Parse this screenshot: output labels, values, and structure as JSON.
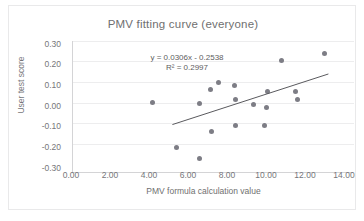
{
  "chart_data": {
    "type": "scatter",
    "title": "PMV fitting curve (everyone)",
    "xlabel": "PMV formula calculation value",
    "ylabel": "User test score",
    "xlim": [
      0.0,
      14.0
    ],
    "ylim": [
      -0.3,
      0.3
    ],
    "xticks": [
      "0.00",
      "2.00",
      "4.00",
      "6.00",
      "8.00",
      "10.00",
      "12.00",
      "14.00"
    ],
    "yticks": [
      "0.30",
      "0.20",
      "0.10",
      "0.00",
      "-0.10",
      "-0.20",
      "-0.30"
    ],
    "grid": true,
    "legend": "none",
    "annotations": {
      "equation": "y = 0.0306x - 0.2538",
      "r_squared": "R² = 0.2997"
    },
    "series": [
      {
        "name": "User test score",
        "marker": "circle",
        "color": "#7d7d85",
        "points": [
          {
            "x": 4.2,
            "y": 0.012
          },
          {
            "x": 5.4,
            "y": -0.205
          },
          {
            "x": 6.6,
            "y": 0.007
          },
          {
            "x": 6.6,
            "y": -0.258
          },
          {
            "x": 7.15,
            "y": 0.077
          },
          {
            "x": 7.2,
            "y": -0.127
          },
          {
            "x": 7.55,
            "y": 0.111
          },
          {
            "x": 8.4,
            "y": 0.093
          },
          {
            "x": 8.45,
            "y": 0.029
          },
          {
            "x": 8.45,
            "y": -0.099
          },
          {
            "x": 9.35,
            "y": 0.001
          },
          {
            "x": 9.9,
            "y": -0.1
          },
          {
            "x": 10.1,
            "y": 0.063
          },
          {
            "x": 10.0,
            "y": -0.014
          },
          {
            "x": 10.8,
            "y": 0.216
          },
          {
            "x": 11.5,
            "y": 0.067
          },
          {
            "x": 11.6,
            "y": 0.028
          },
          {
            "x": 13.0,
            "y": 0.248
          }
        ]
      }
    ],
    "trendline": {
      "type": "linear",
      "slope": 0.0306,
      "intercept": -0.2538,
      "x_start": 5.2,
      "x_end": 13.2,
      "color": "#5a5a5e"
    }
  }
}
